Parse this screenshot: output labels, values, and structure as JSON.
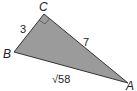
{
  "diagram": {
    "type": "right-triangle",
    "fill_color": "#9b9b9b",
    "stroke_color": "#333333",
    "right_angle_at": "C",
    "vertices": {
      "A": {
        "label": "A"
      },
      "B": {
        "label": "B"
      },
      "C": {
        "label": "C"
      }
    },
    "sides": {
      "BC": {
        "label": "3"
      },
      "CA": {
        "label": "7"
      },
      "BA": {
        "label": "√58"
      }
    }
  }
}
